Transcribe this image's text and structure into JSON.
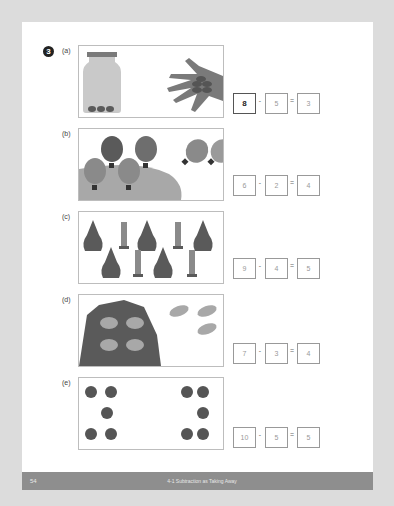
{
  "question_number": "3",
  "colors": {
    "dark": "#5a5a5a",
    "medium": "#8c8c8c",
    "light": "#b8b8b8",
    "footer": "#8e8e8e"
  },
  "problems": [
    {
      "label": "(a)",
      "picture": "jar with 3 items, hand holding 5 items",
      "minuend": "8",
      "operator": "-",
      "subtrahend": "5",
      "equals": "=",
      "result": "3"
    },
    {
      "label": "(b)",
      "picture": "4 hot air balloons on hill, 2 floating away",
      "minuend": "6",
      "operator": "-",
      "subtrahend": "2",
      "equals": "=",
      "result": "4"
    },
    {
      "label": "(c)",
      "picture": "5 pears and 4 pear cores",
      "minuend": "9",
      "operator": "-",
      "subtrahend": "4",
      "equals": "=",
      "result": "5"
    },
    {
      "label": "(d)",
      "picture": "4 frogs on rock, 3 jumping away",
      "minuend": "7",
      "operator": "-",
      "subtrahend": "3",
      "equals": "=",
      "result": "4"
    },
    {
      "label": "(e)",
      "picture": "10 snails, 5 on each side",
      "minuend": "10",
      "operator": "-",
      "subtrahend": "5",
      "equals": "=",
      "result": "5"
    }
  ],
  "footer": {
    "page_number": "54",
    "title": "4-1  Subtraction as Taking Away"
  }
}
